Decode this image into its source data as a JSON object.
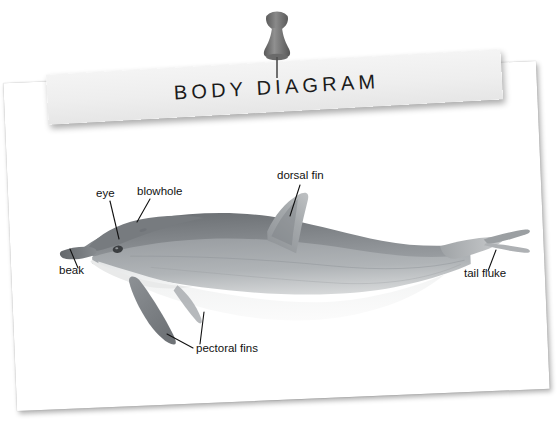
{
  "background": {
    "color": "#ffffff"
  },
  "pushpin": {
    "name": "pushpin",
    "head_color": "#6e6e6e",
    "body_color": "#808080",
    "needle_color": "#5a5a5a"
  },
  "banner": {
    "title": "BODY DIAGRAM",
    "background_color": "#eeeeee",
    "text_color": "#1b1b1b"
  },
  "card": {
    "background_color": "#ffffff"
  },
  "diagram": {
    "style": "grayscale photographic illustration",
    "colors": {
      "dorsal_dark": "#7a7d80",
      "flank_mid": "#9a9da0",
      "belly_light": "#f2f2f2",
      "outline": "#8b8e91",
      "leader_line": "#111111"
    },
    "labels": [
      {
        "id": "eye",
        "text": "eye",
        "x": 96,
        "y": 197
      },
      {
        "id": "blowhole",
        "text": "blowhole",
        "x": 137,
        "y": 195
      },
      {
        "id": "beak",
        "text": "beak",
        "x": 59,
        "y": 274
      },
      {
        "id": "dorsal-fin",
        "text": "dorsal fin",
        "x": 277,
        "y": 179
      },
      {
        "id": "tail-fluke",
        "text": "tail fluke",
        "x": 464,
        "y": 277
      },
      {
        "id": "pectoral-fins",
        "text": "pectoral fins",
        "x": 196,
        "y": 352
      }
    ]
  }
}
